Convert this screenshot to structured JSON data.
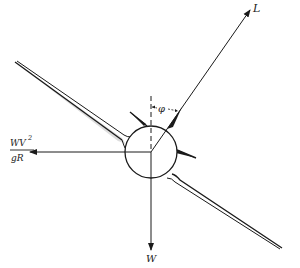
{
  "diagram": {
    "labels": {
      "lift": "L",
      "weight": "W",
      "centrifugal_num": "WV",
      "centrifugal_exp": "2",
      "centrifugal_den": "gR",
      "bank_angle": "φ"
    },
    "colors": {
      "ink": "#1a1a1a",
      "background": "#ffffff"
    }
  }
}
